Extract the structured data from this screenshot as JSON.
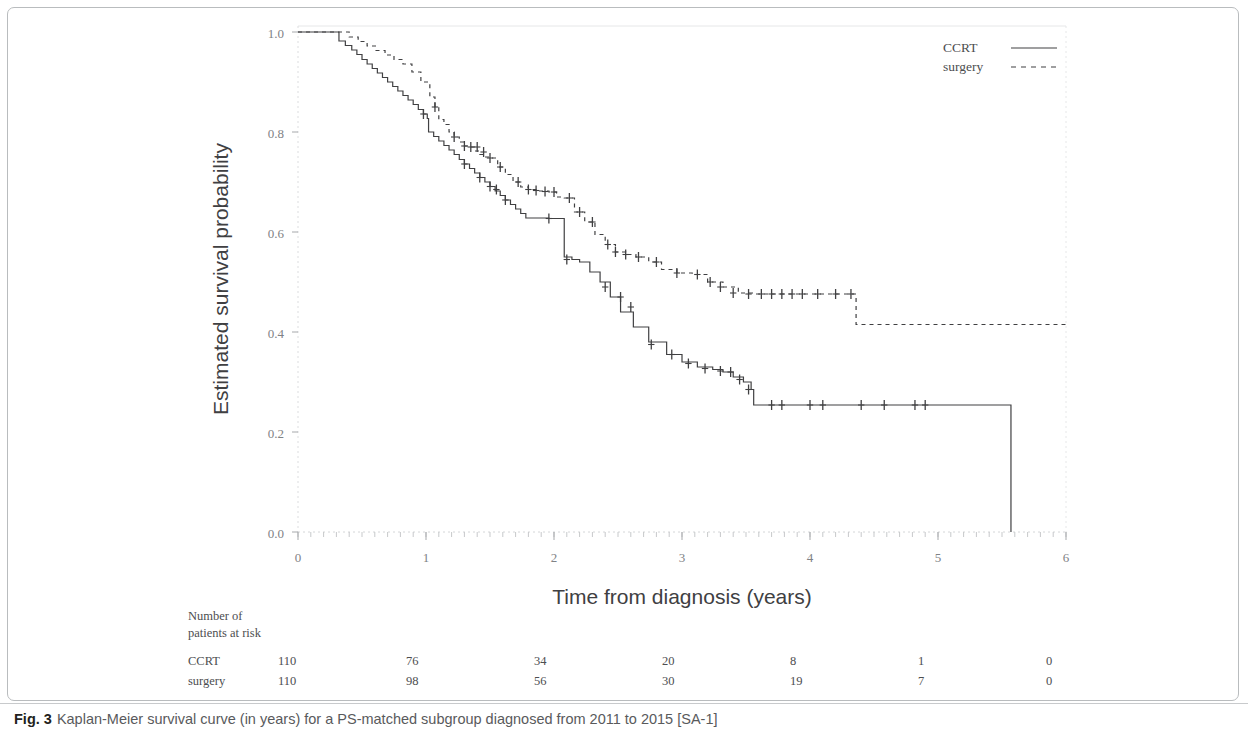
{
  "figure": {
    "caption_label": "Fig. 3",
    "caption_text": "Kaplan-Meier survival curve (in years) for a PS-matched subgroup diagnosed from 2011 to 2015 [SA-1]"
  },
  "legend": {
    "position": "top-right",
    "entries": [
      {
        "name": "CCRT",
        "style": "solid",
        "color": "#404042"
      },
      {
        "name": "surgery",
        "style": "dashed",
        "color": "#404042"
      }
    ]
  },
  "risk_table": {
    "heading_line1": "Number of",
    "heading_line2": "patients at risk",
    "times": [
      0,
      1,
      2,
      3,
      4,
      5,
      6
    ],
    "rows": [
      {
        "label": "CCRT",
        "values": [
          "110",
          "76",
          "34",
          "20",
          "8",
          "1",
          "0"
        ]
      },
      {
        "label": "surgery",
        "values": [
          "110",
          "98",
          "56",
          "30",
          "19",
          "7",
          "0"
        ]
      }
    ]
  },
  "chart_data": {
    "type": "line",
    "title": "",
    "xlabel": "Time from diagnosis (years)",
    "ylabel": "Estimated survival probability",
    "xlim": [
      0,
      6
    ],
    "ylim": [
      0,
      1
    ],
    "xticks": [
      0,
      1,
      2,
      3,
      4,
      5,
      6
    ],
    "xtick_labels": [
      "0",
      "1",
      "2",
      "3",
      "4",
      "5",
      "6"
    ],
    "yticks": [
      0.0,
      0.2,
      0.4,
      0.6,
      0.8,
      1.0
    ],
    "ytick_labels": [
      "0.0",
      "0.2",
      "0.4",
      "0.6",
      "0.8",
      "1.0"
    ],
    "grid": false,
    "legend": [
      "CCRT",
      "surgery"
    ],
    "series": [
      {
        "name": "CCRT",
        "style": "solid",
        "color": "#404042",
        "step": "post",
        "x": [
          0.0,
          0.28,
          0.32,
          0.37,
          0.42,
          0.46,
          0.5,
          0.54,
          0.58,
          0.62,
          0.66,
          0.7,
          0.74,
          0.78,
          0.82,
          0.86,
          0.9,
          0.94,
          0.98,
          1.01,
          1.02,
          1.06,
          1.1,
          1.14,
          1.18,
          1.22,
          1.26,
          1.3,
          1.34,
          1.38,
          1.42,
          1.46,
          1.5,
          1.54,
          1.58,
          1.62,
          1.66,
          1.7,
          1.74,
          1.78,
          1.84,
          1.9,
          1.96,
          2.02,
          2.08,
          2.14,
          2.2,
          2.28,
          2.36,
          2.44,
          2.52,
          2.62,
          2.74,
          2.88,
          3.0,
          3.12,
          3.24,
          3.32,
          3.4,
          3.48,
          3.54,
          3.56,
          5.57,
          5.57
        ],
        "y": [
          1.0,
          1.0,
          0.982,
          0.973,
          0.964,
          0.955,
          0.945,
          0.936,
          0.927,
          0.918,
          0.909,
          0.9,
          0.891,
          0.882,
          0.873,
          0.864,
          0.855,
          0.845,
          0.836,
          0.827,
          0.8,
          0.791,
          0.782,
          0.773,
          0.764,
          0.755,
          0.745,
          0.736,
          0.727,
          0.718,
          0.709,
          0.7,
          0.691,
          0.682,
          0.673,
          0.664,
          0.655,
          0.646,
          0.637,
          0.628,
          0.628,
          0.628,
          0.627,
          0.627,
          0.55,
          0.545,
          0.54,
          0.52,
          0.5,
          0.47,
          0.44,
          0.41,
          0.38,
          0.355,
          0.34,
          0.33,
          0.325,
          0.32,
          0.31,
          0.3,
          0.285,
          0.254,
          0.254,
          0.0
        ],
        "censor_x": [
          0.98,
          1.3,
          1.42,
          1.5,
          1.55,
          1.62,
          1.96,
          2.1,
          2.4,
          2.52,
          2.6,
          2.76,
          2.92,
          3.05,
          3.18,
          3.3,
          3.38,
          3.45,
          3.52,
          3.7,
          3.78,
          4.0,
          4.1,
          4.4,
          4.58,
          4.82,
          4.9
        ],
        "censor_y": [
          0.836,
          0.736,
          0.709,
          0.691,
          0.685,
          0.664,
          0.627,
          0.545,
          0.49,
          0.47,
          0.45,
          0.375,
          0.355,
          0.337,
          0.327,
          0.322,
          0.32,
          0.305,
          0.285,
          0.254,
          0.254,
          0.254,
          0.254,
          0.254,
          0.254,
          0.254,
          0.254
        ]
      },
      {
        "name": "surgery",
        "style": "dashed",
        "color": "#404042",
        "step": "post",
        "x": [
          0.0,
          0.33,
          0.4,
          0.47,
          0.54,
          0.61,
          0.68,
          0.75,
          0.82,
          0.89,
          0.96,
          1.03,
          1.07,
          1.1,
          1.14,
          1.18,
          1.22,
          1.26,
          1.3,
          1.34,
          1.38,
          1.42,
          1.46,
          1.5,
          1.56,
          1.62,
          1.68,
          1.74,
          1.8,
          1.88,
          1.96,
          2.02,
          2.08,
          2.16,
          2.24,
          2.32,
          2.4,
          2.48,
          2.56,
          2.64,
          2.74,
          2.84,
          2.96,
          3.08,
          3.2,
          3.32,
          3.44,
          3.56,
          4.35,
          4.36,
          6.0
        ],
        "y": [
          1.0,
          1.0,
          0.99,
          0.981,
          0.972,
          0.963,
          0.954,
          0.945,
          0.936,
          0.92,
          0.9,
          0.87,
          0.85,
          0.825,
          0.815,
          0.8,
          0.79,
          0.78,
          0.772,
          0.77,
          0.762,
          0.755,
          0.75,
          0.748,
          0.73,
          0.715,
          0.7,
          0.69,
          0.685,
          0.682,
          0.68,
          0.67,
          0.668,
          0.64,
          0.62,
          0.595,
          0.575,
          0.56,
          0.555,
          0.55,
          0.54,
          0.525,
          0.518,
          0.515,
          0.5,
          0.49,
          0.478,
          0.476,
          0.476,
          0.415,
          0.415
        ],
        "censor_x": [
          1.07,
          1.22,
          1.3,
          1.35,
          1.4,
          1.45,
          1.5,
          1.58,
          1.72,
          1.8,
          1.86,
          1.93,
          2.0,
          2.12,
          2.2,
          2.3,
          2.42,
          2.48,
          2.56,
          2.66,
          2.8,
          2.96,
          3.12,
          3.22,
          3.3,
          3.4,
          3.52,
          3.62,
          3.7,
          3.78,
          3.86,
          3.94,
          4.06,
          4.2,
          4.32
        ],
        "censor_y": [
          0.85,
          0.79,
          0.772,
          0.77,
          0.77,
          0.76,
          0.748,
          0.73,
          0.7,
          0.685,
          0.683,
          0.681,
          0.68,
          0.668,
          0.64,
          0.62,
          0.575,
          0.56,
          0.555,
          0.55,
          0.54,
          0.518,
          0.515,
          0.5,
          0.49,
          0.478,
          0.476,
          0.476,
          0.476,
          0.476,
          0.476,
          0.476,
          0.476,
          0.476,
          0.476
        ]
      }
    ]
  }
}
